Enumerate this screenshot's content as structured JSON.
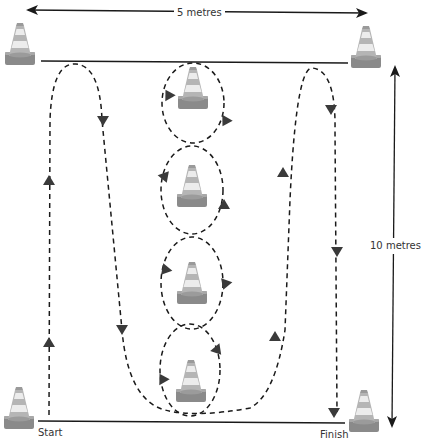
{
  "labels": {
    "width": "5 metres",
    "height": "10 metres",
    "start": "Start",
    "finish": "Finish"
  },
  "colors": {
    "line": "#1a1a1a",
    "arrowhead": "#3a3a3a",
    "cone_base": "#8a8a8a",
    "cone_stripe_light": "#e6e6e6",
    "cone_stripe_dark": "#a9a9a9"
  },
  "cones": [
    {
      "id": "top-left",
      "x": 20,
      "y": 45
    },
    {
      "id": "top-right",
      "x": 366,
      "y": 48
    },
    {
      "id": "centre-1",
      "x": 193,
      "y": 90
    },
    {
      "id": "centre-2",
      "x": 192,
      "y": 188
    },
    {
      "id": "centre-3",
      "x": 192,
      "y": 285
    },
    {
      "id": "centre-4",
      "x": 191,
      "y": 383
    },
    {
      "id": "bottom-left",
      "x": 19,
      "y": 410
    },
    {
      "id": "bottom-right",
      "x": 364,
      "y": 413
    }
  ]
}
